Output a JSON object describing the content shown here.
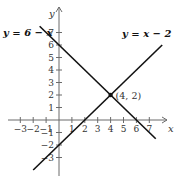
{
  "figure": {
    "type": "linear-system-graph",
    "axes": {
      "x_label": "x",
      "y_label": "y",
      "x_ticks": [
        -3,
        -2,
        -1,
        1,
        2,
        3,
        4,
        5,
        6,
        7
      ],
      "y_ticks": [
        -3,
        -2,
        -1,
        1,
        2,
        3,
        4,
        5,
        6,
        7
      ],
      "x_range": [
        -4,
        8
      ],
      "y_range": [
        -4.4,
        8.4
      ]
    },
    "lines": [
      {
        "label": "y = 6 − x",
        "slope": -1,
        "intercept": 6,
        "x_from": -1.5,
        "x_to": 7.5,
        "color": "#111111"
      },
      {
        "label": "y = x − 2",
        "slope": 1,
        "intercept": -2,
        "x_from": -2.0,
        "x_to": 8.0,
        "color": "#111111"
      }
    ],
    "intersection": {
      "x": 4,
      "y": 2,
      "label": "(4, 2)"
    }
  }
}
